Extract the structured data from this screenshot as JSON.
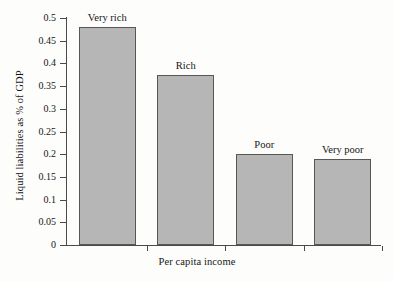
{
  "chart_data": {
    "type": "bar",
    "title": "",
    "categories": [
      "Very rich",
      "Rich",
      "Poor",
      "Very poor"
    ],
    "values": [
      0.48,
      0.375,
      0.2,
      0.19
    ],
    "xlabel": "Per capita income",
    "ylabel": "Liquid liabilities as % of GDP",
    "ylim": [
      0,
      0.5
    ],
    "ytick_labels": [
      "0",
      "0.05",
      "0.1",
      "0.15",
      "0.2",
      "0.25",
      "0.3",
      "0.35",
      "0.4",
      "0.45",
      "0.5"
    ],
    "ytick_values": [
      0,
      0.05,
      0.1,
      0.15,
      0.2,
      0.25,
      0.3,
      0.35,
      0.4,
      0.45,
      0.5
    ],
    "grid": false,
    "legend": false,
    "bar_fill_color": "#b6b6b6",
    "bar_border_color": "#575757",
    "axis_color": "#4a4a4a",
    "background_color": "#fdfdfc"
  }
}
